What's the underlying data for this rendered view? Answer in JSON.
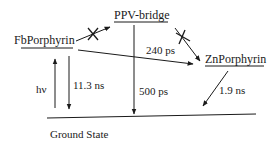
{
  "diagram": {
    "type": "energy-level / photophysical pathway diagram",
    "states": [
      {
        "id": "fb",
        "label": "FbPorphyrin"
      },
      {
        "id": "ppv",
        "label": "PPV-bridge"
      },
      {
        "id": "zn",
        "label": "ZnPorphyrin"
      },
      {
        "id": "gs",
        "label": "Ground State"
      }
    ],
    "transitions": [
      {
        "from": "gs",
        "to": "fb",
        "label": "hν",
        "blocked": false
      },
      {
        "from": "fb",
        "to": "gs",
        "label": "11.3 ns",
        "blocked": false
      },
      {
        "from": "fb",
        "to": "ppv",
        "label": "",
        "blocked": true
      },
      {
        "from": "ppv",
        "to": "gs",
        "label": "500 ps",
        "blocked": false
      },
      {
        "from": "ppv",
        "to": "zn",
        "label": "",
        "blocked": true
      },
      {
        "from": "fb",
        "to": "zn",
        "label": "240 ps",
        "blocked": false
      },
      {
        "from": "zn",
        "to": "gs",
        "label": "1.9 ns",
        "blocked": false
      }
    ]
  },
  "labels": {
    "fb": "FbPorphyrin",
    "ppv": "PPV-bridge",
    "zn": "ZnPorphyrin",
    "gs": "Ground State",
    "hv": "hν",
    "t_fb": "11.3 ns",
    "t_ppv": "500 ps",
    "t_et": "240 ps",
    "t_zn": "1.9 ns"
  },
  "colors": {
    "ink": "#1a1a1a",
    "background": "#ffffff"
  }
}
